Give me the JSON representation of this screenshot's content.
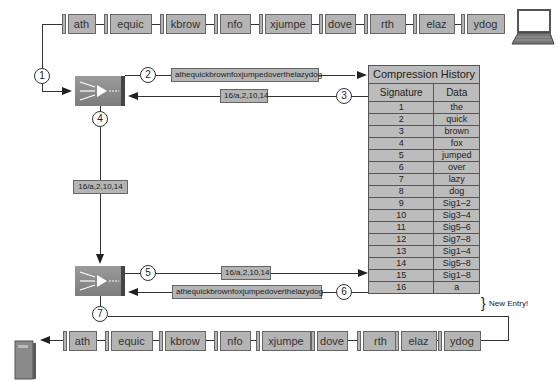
{
  "top_packets": [
    "ath",
    "equic",
    "kbrow",
    "nfo",
    "xjumpe",
    "dove",
    "rth",
    "elaz",
    "ydog"
  ],
  "bottom_packets": [
    "ath",
    "equic",
    "kbrow",
    "nfo",
    "xjumpe",
    "dove",
    "rth",
    "elaz",
    "ydog"
  ],
  "steps": [
    "1",
    "2",
    "3",
    "4",
    "5",
    "6",
    "7"
  ],
  "flows": {
    "uncompressed": "athequickbrownfoxjumpedoverthelazydog",
    "compressed": "16/a,2,10,14"
  },
  "table": {
    "title": "Compression History",
    "headers": [
      "Signature",
      "Data"
    ],
    "rows": [
      [
        "1",
        "the"
      ],
      [
        "2",
        "quick"
      ],
      [
        "3",
        "brown"
      ],
      [
        "4",
        "fox"
      ],
      [
        "5",
        "jumped"
      ],
      [
        "6",
        "over"
      ],
      [
        "7",
        "lazy"
      ],
      [
        "8",
        "dog"
      ],
      [
        "9",
        "Sig1–2"
      ],
      [
        "10",
        "Sig3–4"
      ],
      [
        "11",
        "Sig5–6"
      ],
      [
        "12",
        "Sig7–8"
      ],
      [
        "13",
        "Sig1–4"
      ],
      [
        "14",
        "Sig5–8"
      ],
      [
        "15",
        "Sig1–8"
      ],
      [
        "16",
        "a"
      ]
    ]
  },
  "annotation": "New Entry!",
  "icons": [
    "laptop-icon",
    "router-icon",
    "server-icon"
  ]
}
